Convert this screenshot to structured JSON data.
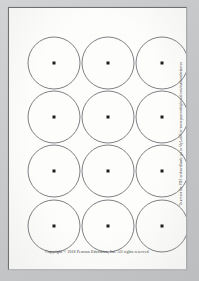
{
  "page": {
    "document_type": "printable-worksheet",
    "background_color": "#c8c9cb",
    "sheet_color": "#fdfdfc",
    "border_color": "#6e6f71"
  },
  "grid": {
    "columns": 3,
    "rows": 4,
    "circle_count": 12,
    "circle_diameter_px": 53,
    "circle_stroke_color": "#7f8084",
    "center_dot_color": "#1d1d1f",
    "column_centers_x": [
      45,
      99,
      153
    ],
    "row_centers_y": [
      55,
      109,
      163,
      218
    ],
    "circles": [
      {
        "id": "circle-r1-c1",
        "cx": 45,
        "cy": 55
      },
      {
        "id": "circle-r1-c2",
        "cx": 99,
        "cy": 55
      },
      {
        "id": "circle-r1-c3",
        "cx": 153,
        "cy": 55
      },
      {
        "id": "circle-r2-c1",
        "cx": 45,
        "cy": 109
      },
      {
        "id": "circle-r2-c2",
        "cx": 99,
        "cy": 109
      },
      {
        "id": "circle-r2-c3",
        "cx": 153,
        "cy": 109
      },
      {
        "id": "circle-r3-c1",
        "cx": 45,
        "cy": 163
      },
      {
        "id": "circle-r3-c2",
        "cx": 99,
        "cy": 163
      },
      {
        "id": "circle-r3-c3",
        "cx": 153,
        "cy": 163
      },
      {
        "id": "circle-r4-c1",
        "cx": 45,
        "cy": 218
      },
      {
        "id": "circle-r4-c2",
        "cx": 99,
        "cy": 218
      },
      {
        "id": "circle-r4-c3",
        "cx": 153,
        "cy": 218
      }
    ]
  },
  "footer": {
    "copyright": "Copyright © 2018 Pearson Education, Inc.  All rights reserved."
  },
  "side_note": {
    "text": "To access the PDF or downloads, go to MyLab® or www.pearsonhighered.com/mathandsciences"
  }
}
